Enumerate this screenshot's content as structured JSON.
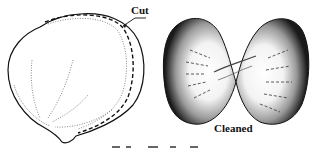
{
  "figure": {
    "panels": [
      {
        "id": "cut",
        "label": "Cut",
        "description": "Whole seed outline with dashed cut line along right edge"
      },
      {
        "id": "cleaned",
        "label": "Cleaned",
        "description": "Opened seed showing two stippled halves"
      }
    ],
    "caption_cropped": true
  },
  "colors": {
    "ink": "#111111",
    "background": "#ffffff"
  }
}
